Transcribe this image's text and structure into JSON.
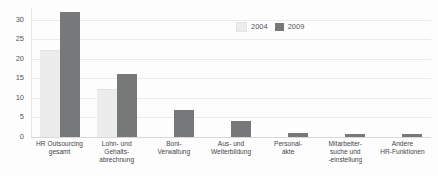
{
  "chart_data": {
    "type": "bar",
    "title": "",
    "subtitle": "",
    "xlabel": "",
    "ylabel": "",
    "ylim": [
      0,
      33
    ],
    "yticks": [
      0,
      5,
      10,
      15,
      20,
      25,
      30
    ],
    "ytick_labels": [
      "0",
      "5",
      "10",
      "15",
      "20",
      "25",
      "30"
    ],
    "grid": true,
    "legend_position": "top-right",
    "categories": [
      "HR Outsourcing gesamt",
      "Lohn- und Gehaltsabrechnung",
      "Boni-Verwaltung",
      "Aus- und Weiterbildung",
      "Personalakte",
      "Mitarbeitersuche und -einstellung",
      "Andere HR-Funktionen"
    ],
    "category_lines": [
      [
        "HR Outsourcing",
        "gesamt"
      ],
      [
        "Lohn- und",
        "Gehalts-",
        "abrechnung"
      ],
      [
        "Boni-",
        "Verwaltung"
      ],
      [
        "Aus- und",
        "Weiterbildung"
      ],
      [
        "Personal-",
        "akte"
      ],
      [
        "Mitarbeiter-",
        "suche und",
        "-einstellung"
      ],
      [
        "Andere",
        "HR-Funktionen"
      ]
    ],
    "series": [
      {
        "name": "2004",
        "color": "#ececec",
        "values": [
          22,
          12,
          0,
          0,
          0,
          0,
          0
        ]
      },
      {
        "name": "2009",
        "color": "#77787a",
        "values": [
          32,
          16,
          7,
          4,
          1,
          0.8,
          0.8
        ]
      }
    ]
  },
  "legend": {
    "items": [
      {
        "label": "2004",
        "color": "#ececec"
      },
      {
        "label": "2009",
        "color": "#77787a"
      }
    ]
  },
  "colors": {
    "series_2004": "#ececec",
    "series_2009": "#77787a",
    "grid": "#eceaea",
    "axis": "#d9d7d7",
    "text": "#46454a",
    "background": "#fdfdfd"
  }
}
